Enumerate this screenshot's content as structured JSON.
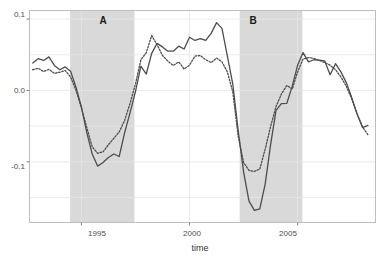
{
  "chart_data": {
    "type": "line",
    "title": "",
    "xlabel": "time",
    "ylabel": "",
    "xlim": [
      1992.6,
      2008.6
    ],
    "ylim": [
      -0.185,
      0.112
    ],
    "grid": true,
    "legend": "none",
    "x_ticks": [
      1995,
      2000,
      2005
    ],
    "x_tick_labels": [
      "1995",
      "2000",
      "2005"
    ],
    "y_ticks": [
      -0.1,
      0.0,
      0.1
    ],
    "y_tick_labels": [
      "-0.1",
      "0.0",
      "0.1"
    ],
    "gridlines_y": [
      -0.15,
      -0.1,
      -0.05,
      0.0,
      0.05,
      0.1
    ],
    "gridlines_x": [
      1995,
      2000,
      2005
    ],
    "annotations": [
      {
        "label": "A",
        "x": 1995.9,
        "y": 0.098,
        "type": "band-label"
      },
      {
        "label": "B",
        "x": 2003.25,
        "y": 0.098,
        "type": "band-label"
      }
    ],
    "shaded_bands": [
      {
        "name": "A",
        "x_start": 1994.48,
        "x_end": 1997.45,
        "color": "#d9d9d9"
      },
      {
        "name": "B",
        "x_start": 2002.32,
        "x_end": 2005.22,
        "color": "#d9d9d9"
      }
    ],
    "series": [
      {
        "name": "solid",
        "style": "solid",
        "color": "#4d4d4d",
        "x": [
          1992.75,
          1993.0,
          1993.25,
          1993.5,
          1993.75,
          1994.0,
          1994.25,
          1994.5,
          1994.75,
          1995.0,
          1995.25,
          1995.5,
          1995.75,
          1996.0,
          1996.25,
          1996.5,
          1996.75,
          1997.0,
          1997.25,
          1997.5,
          1997.75,
          1998.0,
          1998.25,
          1998.5,
          1998.75,
          1999.0,
          1999.25,
          1999.5,
          1999.75,
          2000.0,
          2000.25,
          2000.5,
          2000.75,
          2001.0,
          2001.25,
          2001.5,
          2001.75,
          2002.0,
          2002.25,
          2002.5,
          2002.75,
          2003.0,
          2003.25,
          2003.5,
          2003.75,
          2004.0,
          2004.25,
          2004.5,
          2004.75,
          2005.0,
          2005.25,
          2005.5,
          2005.75,
          2006.0,
          2006.25,
          2006.5,
          2006.75,
          2007.0,
          2007.25,
          2007.5,
          2007.75,
          2008.0,
          2008.25
        ],
        "y": [
          0.0385,
          0.0445,
          0.042,
          0.047,
          0.035,
          0.029,
          0.033,
          0.027,
          0.0045,
          -0.023,
          -0.059,
          -0.089,
          -0.106,
          -0.101,
          -0.094,
          -0.089,
          -0.0925,
          -0.059,
          -0.031,
          -0.0015,
          0.034,
          0.023,
          0.052,
          0.066,
          0.061,
          0.055,
          0.055,
          0.062,
          0.058,
          0.0745,
          0.07,
          0.0725,
          0.07,
          0.08,
          0.095,
          0.087,
          0.048,
          0.009,
          -0.056,
          -0.114,
          -0.155,
          -0.168,
          -0.166,
          -0.131,
          -0.076,
          -0.028,
          -0.0185,
          -0.018,
          0.006,
          0.0355,
          0.053,
          0.04,
          0.043,
          0.0425,
          0.0415,
          0.022,
          0.0375,
          0.026,
          0.011,
          -0.01,
          -0.033,
          -0.052,
          -0.049
        ],
        "line_width": 1.3
      },
      {
        "name": "dotted",
        "style": "dotted",
        "color": "#4d4d4d",
        "x": [
          1992.75,
          1993.0,
          1993.25,
          1993.5,
          1993.75,
          1994.0,
          1994.25,
          1994.5,
          1994.75,
          1995.0,
          1995.25,
          1995.5,
          1995.75,
          1996.0,
          1996.25,
          1996.5,
          1996.75,
          1997.0,
          1997.25,
          1997.5,
          1997.75,
          1998.0,
          1998.25,
          1998.5,
          1998.75,
          1999.0,
          1999.25,
          1999.5,
          1999.75,
          2000.0,
          2000.25,
          2000.5,
          2000.75,
          2001.0,
          2001.25,
          2001.5,
          2001.75,
          2002.0,
          2002.25,
          2002.5,
          2002.75,
          2003.0,
          2003.25,
          2003.5,
          2003.75,
          2004.0,
          2004.25,
          2004.5,
          2004.75,
          2005.0,
          2005.25,
          2005.5,
          2005.75,
          2006.0,
          2006.25,
          2006.5,
          2006.75,
          2007.0,
          2007.25,
          2007.5,
          2007.75,
          2008.0,
          2008.25
        ],
        "y": [
          0.029,
          0.031,
          0.0265,
          0.0295,
          0.024,
          0.0255,
          0.028,
          0.019,
          0.0,
          -0.0245,
          -0.052,
          -0.079,
          -0.088,
          -0.086,
          -0.076,
          -0.067,
          -0.058,
          -0.042,
          -0.018,
          0.009,
          0.043,
          0.053,
          0.077,
          0.064,
          0.049,
          0.041,
          0.035,
          0.04,
          0.03,
          0.0355,
          0.048,
          0.049,
          0.043,
          0.039,
          0.0455,
          0.04,
          0.026,
          -0.002,
          -0.064,
          -0.101,
          -0.112,
          -0.1135,
          -0.11,
          -0.082,
          -0.0505,
          -0.0225,
          -0.005,
          0.007,
          0.002,
          0.026,
          0.044,
          0.046,
          0.045,
          0.042,
          0.039,
          0.0355,
          0.029,
          0.019,
          0.006,
          -0.012,
          -0.033,
          -0.051,
          -0.062
        ],
        "line_width": 1.3
      }
    ]
  },
  "axis": {
    "x_title": "time"
  }
}
